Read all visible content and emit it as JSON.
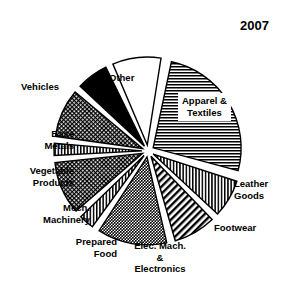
{
  "chart_data": {
    "type": "pie",
    "title": "2007",
    "xlabel": "",
    "ylabel": "",
    "legend_position": "none",
    "grid": false,
    "labels_outside": true,
    "exploded": true,
    "categories": [
      "Apparel & Textiles",
      "Leather Goods",
      "Footwear",
      "Elec. Mach. & Electronics",
      "Prepared Food",
      "Mech. Machinery",
      "Vegetable Products",
      "Base Metals",
      "Vehicles",
      "Other"
    ],
    "values": [
      26,
      7,
      8,
      13,
      3,
      10,
      2,
      9,
      6,
      16
    ],
    "units": "percent",
    "slices": [
      {
        "label": "Apparel & Textiles",
        "value": 26,
        "start_angle": 12,
        "end_angle": 105,
        "fill": "horizontal-lines",
        "color": "#000000"
      },
      {
        "label": "Leather Goods",
        "value": 7,
        "start_angle": 108,
        "end_angle": 133,
        "fill": "vertical-lines",
        "color": "#000000"
      },
      {
        "label": "Footwear",
        "value": 8,
        "start_angle": 136,
        "end_angle": 164,
        "fill": "diagonal-lines-back",
        "color": "#000000"
      },
      {
        "label": "Elec. Mach. & Electronics",
        "value": 13,
        "start_angle": 167,
        "end_angle": 213,
        "fill": "dots",
        "color": "#000000"
      },
      {
        "label": "Prepared Food",
        "value": 3,
        "start_angle": 216,
        "end_angle": 226,
        "fill": "vertical-lines",
        "color": "#000000"
      },
      {
        "label": "Mech. Machinery",
        "value": 10,
        "start_angle": 229,
        "end_angle": 264,
        "fill": "fine-crosshatch",
        "color": "#000000"
      },
      {
        "label": "Vegetable Products",
        "value": 2,
        "start_angle": 267,
        "end_angle": 275,
        "fill": "vertical-lines",
        "color": "#000000"
      },
      {
        "label": "Base Metals",
        "value": 9,
        "start_angle": 278,
        "end_angle": 310,
        "fill": "fine-crosshatch",
        "color": "#000000"
      },
      {
        "label": "Vehicles",
        "value": 6,
        "start_angle": 313,
        "end_angle": 334,
        "fill": "solid-black",
        "color": "#000000"
      },
      {
        "label": "Other",
        "value": 16,
        "start_angle": 337,
        "end_angle": 9,
        "fill": "white",
        "color": "#ffffff"
      }
    ]
  },
  "title": {
    "text": "2007"
  },
  "labels": {
    "apparel_line1": "Apparel &",
    "apparel_line2": "Textiles",
    "leather_line1": "Leather",
    "leather_line2": "Goods",
    "footwear": "Footwear",
    "elec_line1": "Elec. Mach.",
    "elec_line2": "&",
    "elec_line3": "Electronics",
    "prepared_line1": "Prepared",
    "prepared_line2": "Food",
    "mech_line1": "Mech.",
    "mech_line2": "Machinery",
    "vegetable_line1": "Vegetable",
    "vegetable_line2": "Products",
    "base_line1": "Base",
    "base_line2": "Metals",
    "vehicles": "Vehicles",
    "other": "Other"
  },
  "colors": {
    "background": "#ffffff",
    "stroke": "#000000",
    "text": "#000000"
  }
}
